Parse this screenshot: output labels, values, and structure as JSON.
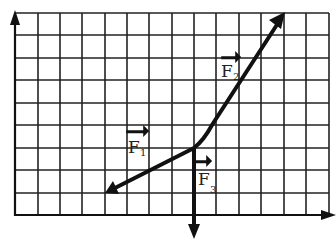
{
  "diagram": {
    "type": "force-vector-grid",
    "grid": {
      "columns": 14,
      "rows": 9,
      "origin_px": [
        15,
        215
      ],
      "cell_px": 22.4,
      "line_color": "#222222"
    },
    "axes": {
      "x_arrow": true,
      "y_arrow": true
    },
    "vectors": [
      {
        "id": "F1",
        "label": "F",
        "subscript": "1",
        "from_cell": [
          8,
          3
        ],
        "to_cell": [
          4,
          1
        ]
      },
      {
        "id": "F2",
        "label": "F",
        "subscript": "2",
        "from_cell": [
          8,
          3
        ],
        "to_cell": [
          12,
          9
        ]
      },
      {
        "id": "F3",
        "label": "F",
        "subscript": "3",
        "from_cell": [
          8,
          3
        ],
        "to_cell": [
          8,
          -1
        ]
      }
    ],
    "labels": {
      "f1_main": "F",
      "f1_sub": "1",
      "f2_main": "F",
      "f2_sub": "2",
      "f3_main": "F",
      "f3_sub": "3"
    }
  }
}
